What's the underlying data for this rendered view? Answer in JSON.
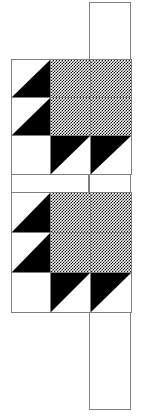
{
  "figure": {
    "background_color": "#ffffff",
    "line_color": "#808080",
    "solid_fill_color": "#000000",
    "dotted_fill_color": "#101010",
    "canvas": {
      "width": 141,
      "height": 416
    }
  },
  "sashing": [
    {
      "name": "top-sash",
      "label": "top sashing strip",
      "fill": "plain",
      "x": 89,
      "y": 2,
      "width": 42,
      "height": 59
    },
    {
      "name": "middle-sash-left",
      "label": "middle sashing strip left",
      "fill": "plain",
      "x": 11,
      "y": 174,
      "width": 78,
      "height": 19
    },
    {
      "name": "middle-sash-right",
      "label": "middle sashing strip right",
      "fill": "plain",
      "x": 89,
      "y": 174,
      "width": 42,
      "height": 19
    },
    {
      "name": "bottom-sash",
      "label": "bottom sashing strip",
      "fill": "plain",
      "x": 89,
      "y": 312,
      "width": 42,
      "height": 98
    }
  ],
  "blocks": [
    {
      "name": "quilt-block-top",
      "label": "Quilt block 1",
      "x": 11,
      "y": 59,
      "width": 120,
      "height": 115,
      "columns": 3,
      "rows": 3,
      "col_edges": [
        0,
        39,
        79,
        120
      ],
      "row_edges": [
        0,
        38,
        76,
        115
      ],
      "cells": [
        {
          "r": 0,
          "c": 0,
          "fill": "half-triangle",
          "orient": "bottom-right",
          "label": "half-square triangle dark lower-right"
        },
        {
          "r": 0,
          "c": 1,
          "fill": "dotted",
          "orient": "none",
          "label": "dotted square (part of 2x2 center)"
        },
        {
          "r": 0,
          "c": 2,
          "fill": "dotted",
          "orient": "none",
          "label": "dotted square (part of 2x2 center)"
        },
        {
          "r": 1,
          "c": 0,
          "fill": "half-triangle",
          "orient": "bottom-right",
          "label": "half-square triangle dark lower-right"
        },
        {
          "r": 1,
          "c": 1,
          "fill": "dotted",
          "orient": "none",
          "label": "dotted square (part of 2x2 center)"
        },
        {
          "r": 1,
          "c": 2,
          "fill": "dotted",
          "orient": "none",
          "label": "dotted square (part of 2x2 center)"
        },
        {
          "r": 2,
          "c": 0,
          "fill": "plain",
          "orient": "none",
          "label": "plain white square"
        },
        {
          "r": 2,
          "c": 1,
          "fill": "half-triangle",
          "orient": "top-left",
          "label": "half-square triangle dark upper-left"
        },
        {
          "r": 2,
          "c": 2,
          "fill": "half-triangle",
          "orient": "top-left",
          "label": "half-square triangle dark upper-left"
        }
      ]
    },
    {
      "name": "quilt-block-bottom",
      "label": "Quilt block 2",
      "x": 11,
      "y": 192,
      "width": 120,
      "height": 120,
      "columns": 3,
      "rows": 3,
      "col_edges": [
        0,
        39,
        79,
        120
      ],
      "row_edges": [
        0,
        40,
        80,
        120
      ],
      "cells": [
        {
          "r": 0,
          "c": 0,
          "fill": "half-triangle",
          "orient": "bottom-right",
          "label": "half-square triangle dark lower-right"
        },
        {
          "r": 0,
          "c": 1,
          "fill": "dotted",
          "orient": "none",
          "label": "dotted square (part of 2x2 center)"
        },
        {
          "r": 0,
          "c": 2,
          "fill": "dotted",
          "orient": "none",
          "label": "dotted square (part of 2x2 center)"
        },
        {
          "r": 1,
          "c": 0,
          "fill": "half-triangle",
          "orient": "bottom-right",
          "label": "half-square triangle dark lower-right"
        },
        {
          "r": 1,
          "c": 1,
          "fill": "dotted",
          "orient": "none",
          "label": "dotted square (part of 2x2 center)"
        },
        {
          "r": 1,
          "c": 2,
          "fill": "dotted",
          "orient": "none",
          "label": "dotted square (part of 2x2 center)"
        },
        {
          "r": 2,
          "c": 0,
          "fill": "plain",
          "orient": "none",
          "label": "plain white square"
        },
        {
          "r": 2,
          "c": 1,
          "fill": "half-triangle",
          "orient": "top-left",
          "label": "half-square triangle dark upper-left"
        },
        {
          "r": 2,
          "c": 2,
          "fill": "half-triangle",
          "orient": "top-left",
          "label": "half-square triangle dark upper-left"
        }
      ]
    }
  ]
}
